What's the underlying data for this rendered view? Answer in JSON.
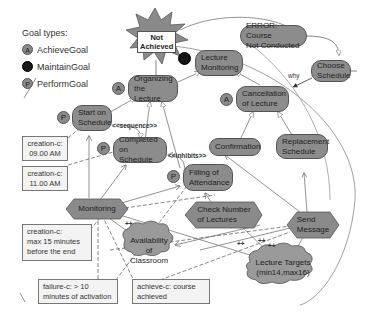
{
  "legend": {
    "title": "Goal types:",
    "items": [
      {
        "badge": "A",
        "label": "AchieveGoal",
        "style": "grey"
      },
      {
        "badge": "",
        "label": "MaintainGoal",
        "style": "black"
      },
      {
        "badge": "P",
        "label": "PerformGoal",
        "style": "grey"
      }
    ]
  },
  "failure_star": {
    "label_line1": "Not",
    "label_line2": "Achieved"
  },
  "goals": {
    "lecture_monitoring": {
      "line1": "Lecture",
      "line2": "Monitoring",
      "type": "MaintainGoal"
    },
    "organizing_lecture": {
      "line1": "Organizing",
      "line2": "the Lecture",
      "type": "A"
    },
    "start_on_schedule": {
      "line1": "Start on",
      "line2": "Schedule",
      "type": "P"
    },
    "completed_on_schedule": {
      "line1": "Completed",
      "line2": "on Schedule",
      "type": "P"
    },
    "filling_attendance": {
      "line1": "Filling of",
      "line2": "Attendance",
      "type": "P"
    },
    "error_course": {
      "line1": "ERROR: Course",
      "line2": "Not Conducted"
    },
    "choose_schedule": {
      "line1": "Choose",
      "line2": "Schedule"
    },
    "cancellation": {
      "line1": "Cancellation",
      "line2": "of Lecture",
      "type": "A"
    },
    "confirmation": {
      "line1": "Confirmation"
    },
    "replacement": {
      "line1": "Replacement",
      "line2": "Schedule"
    }
  },
  "roles": {
    "monitoring": {
      "label": "Monitoring"
    },
    "check_number": {
      "line1": "Check Number",
      "line2": "of Lectures"
    },
    "send_message": {
      "line1": "Send",
      "line2": "Message"
    }
  },
  "resources": {
    "availability": {
      "line1": "Availability",
      "line2": "of Classroom"
    },
    "lecture_targets": {
      "line1": "Lecture Targets",
      "line2": "(min14,max16)"
    }
  },
  "notes": {
    "creation1": {
      "line1": "creation-c:",
      "line2": "09.00 AM"
    },
    "creation2": {
      "line1": "creation-c:",
      "line2": "11.00 AM"
    },
    "creation3": {
      "line1": "creation-c:",
      "line2": "max 15 minutes",
      "line3": "before the end"
    },
    "failure": {
      "line1": "failure-c: > 10",
      "line2": "minutes of activation"
    },
    "achieve": {
      "line1": "achieve-c: course",
      "line2": "achieved"
    }
  },
  "edge_labels": {
    "sequence": "<<sequence>>",
    "inhibits": "<<inhibits>>",
    "why": "why",
    "plus1": "++",
    "plus2": "++",
    "plus3": "++",
    "plus4": "++"
  },
  "colors": {
    "goal_fill": "#8c8c8c",
    "node_border": "#555555",
    "note_fill": "#f3f3f3",
    "maintain_badge": "#151515"
  }
}
